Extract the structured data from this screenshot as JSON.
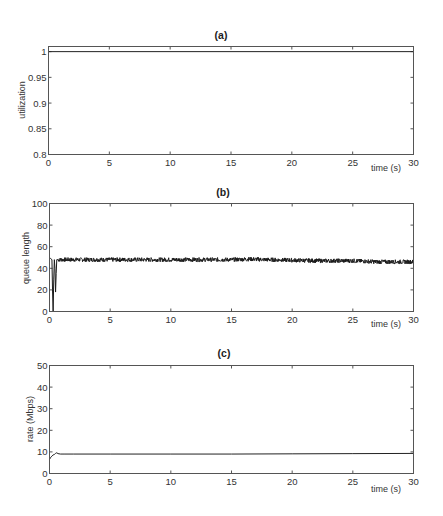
{
  "figure": {
    "panels": [
      {
        "id": "a",
        "title": "(a)",
        "ylabel": "utilization",
        "xlabel": "time (s)"
      },
      {
        "id": "b",
        "title": "(b)",
        "ylabel": "queue length",
        "xlabel": "time (s)"
      },
      {
        "id": "c",
        "title": "(c)",
        "ylabel": "rate (Mbps)",
        "xlabel": "time (s)"
      }
    ]
  },
  "chart_data": [
    {
      "type": "line",
      "title": "(a)",
      "xlabel": "time (s)",
      "ylabel": "utilization",
      "xlim": [
        0,
        30
      ],
      "ylim": [
        0.8,
        1.01
      ],
      "xticks": [
        0,
        5,
        10,
        15,
        20,
        25,
        30
      ],
      "yticks": [
        0.8,
        0.85,
        0.9,
        0.95,
        1
      ],
      "ytick_labels": [
        "0.8",
        "0.85",
        "0.9",
        "0.95",
        "1"
      ],
      "grid": false,
      "series": [
        {
          "name": "utilization",
          "x": [
            0,
            30
          ],
          "y": [
            1.0,
            1.0
          ]
        }
      ]
    },
    {
      "type": "line",
      "title": "(b)",
      "xlabel": "time (s)",
      "ylabel": "queue length",
      "xlim": [
        0,
        30
      ],
      "ylim": [
        0,
        100
      ],
      "xticks": [
        0,
        5,
        10,
        15,
        20,
        25,
        30
      ],
      "yticks": [
        0,
        20,
        40,
        60,
        80,
        100
      ],
      "ytick_labels": [
        "0",
        "20",
        "40",
        "60",
        "80",
        "100"
      ],
      "grid": false,
      "series": [
        {
          "name": "queue length",
          "x": [
            0,
            0.1,
            0.2,
            0.25,
            0.3,
            0.35,
            0.4,
            0.45,
            0.5,
            0.55,
            0.6,
            0.7,
            1,
            2,
            5,
            8,
            10,
            12,
            15,
            16.5,
            18,
            20,
            22,
            25,
            27,
            30
          ],
          "y": [
            50,
            49,
            48,
            20,
            0,
            30,
            48,
            40,
            18,
            35,
            48,
            48,
            48,
            48,
            48,
            48,
            48,
            48,
            48,
            48.5,
            48,
            47.5,
            47,
            47,
            46,
            46
          ],
          "noise_amplitude": 2
        }
      ]
    },
    {
      "type": "line",
      "title": "(c)",
      "xlabel": "time (s)",
      "ylabel": "rate (Mbps)",
      "xlim": [
        0,
        30
      ],
      "ylim": [
        0,
        50
      ],
      "xticks": [
        0,
        5,
        10,
        15,
        20,
        25,
        30
      ],
      "yticks": [
        0,
        10,
        20,
        30,
        40,
        50
      ],
      "ytick_labels": [
        "0",
        "10",
        "20",
        "30",
        "40",
        "50"
      ],
      "grid": false,
      "series": [
        {
          "name": "rate",
          "x": [
            0,
            0.1,
            0.2,
            0.3,
            0.4,
            0.5,
            0.6,
            0.7,
            0.9,
            1.2,
            2,
            5,
            10,
            15,
            20,
            25,
            30
          ],
          "y": [
            6.5,
            7.5,
            8.0,
            8.6,
            8.8,
            9.3,
            9.6,
            9.2,
            9.0,
            9.0,
            9.0,
            9.0,
            9.0,
            9.0,
            9.1,
            9.2,
            9.3
          ]
        }
      ]
    }
  ]
}
